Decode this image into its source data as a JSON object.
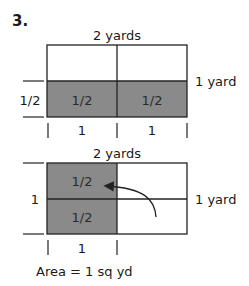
{
  "problem_number": "3.",
  "colors": {
    "shade": "#8a8a8a",
    "line": "#222222",
    "background": "#ffffff"
  },
  "top_diagram": {
    "width_label": "2 yards",
    "height_label": "1 yard",
    "left_label": "1/2",
    "cells": [
      "1/2",
      "1/2"
    ],
    "bottom_labels": [
      "1",
      "1"
    ]
  },
  "bottom_diagram": {
    "width_label": "2 yards",
    "height_label": "1 yard",
    "left_label": "1",
    "cells": [
      "1/2",
      "1/2"
    ],
    "bottom_labels": [
      "1"
    ],
    "area_label": "Area = 1 sq yd"
  }
}
